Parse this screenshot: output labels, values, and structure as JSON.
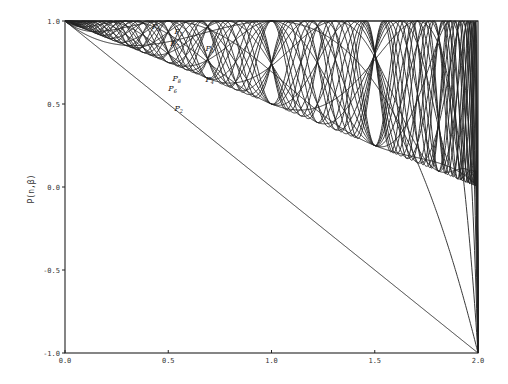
{
  "chart_data": {
    "type": "line",
    "title": "",
    "xlabel": "",
    "ylabel": "P(n,β)",
    "xlim": [
      0.0,
      2.0
    ],
    "ylim": [
      -1.0,
      1.0
    ],
    "x_ticks": [
      {
        "value": 0.0,
        "label": "0.0"
      },
      {
        "value": 0.5,
        "label": "0.5"
      },
      {
        "value": 1.0,
        "label": "1.0"
      },
      {
        "value": 1.5,
        "label": "1.5"
      },
      {
        "value": 2.0,
        "label": "2.0"
      }
    ],
    "y_ticks": [
      {
        "value": 1.0,
        "label": "1.0"
      },
      {
        "value": 0.5,
        "label": "0.5"
      },
      {
        "value": 0.0,
        "label": "0.0"
      },
      {
        "value": -0.5,
        "label": "-0.5"
      },
      {
        "value": -1.0,
        "label": "-1.0"
      }
    ],
    "grid": false,
    "legend": "none (curves labeled inline)",
    "curve_family": "P(n,beta) for n = 1..24, bounded above by 1 and below by 1 - beta",
    "labeled_series": [
      {
        "name": "P1",
        "n": 1,
        "label_at": [
          0.42,
          0.95
        ]
      },
      {
        "name": "P5",
        "n": 5,
        "label_at": [
          0.53,
          0.92
        ]
      },
      {
        "name": "P7",
        "n": 7,
        "label_at": [
          0.51,
          0.85
        ]
      },
      {
        "name": "P3",
        "n": 3,
        "label_at": [
          0.68,
          0.82
        ]
      },
      {
        "name": "P8",
        "n": 8,
        "label_at": [
          0.52,
          0.64
        ]
      },
      {
        "name": "P4",
        "n": 4,
        "label_at": [
          0.68,
          0.63
        ]
      },
      {
        "name": "P6",
        "n": 6,
        "label_at": [
          0.5,
          0.58
        ]
      },
      {
        "name": "P2",
        "n": 2,
        "label_at": [
          0.53,
          0.46
        ]
      }
    ],
    "series_n": [
      1,
      2,
      3,
      4,
      5,
      6,
      7,
      8,
      9,
      10,
      11,
      12,
      13,
      14,
      15,
      16,
      17,
      18,
      19,
      20,
      21,
      22,
      23,
      24
    ],
    "key_points": {
      "common_crossing": [
        1.555,
        0.51
      ],
      "odd_n_value_at_beta_1": 1.0,
      "even_n_value_at_beta_1": 0.0,
      "all_start_at": [
        0.0,
        1.0
      ],
      "all_end_at_beta_2_between": [
        -1.0,
        1.0
      ]
    }
  }
}
